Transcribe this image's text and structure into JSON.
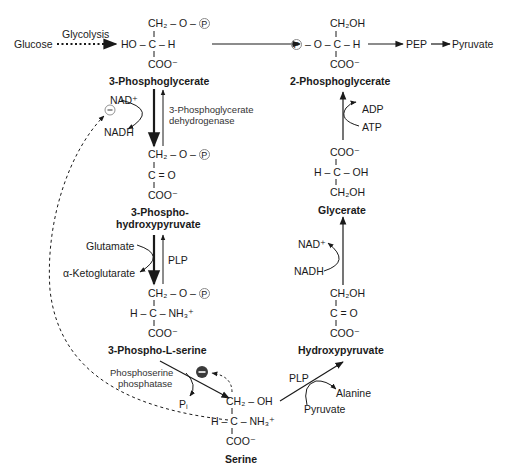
{
  "diagram": {
    "molecules": {
      "phosphoglycerate3": {
        "name": "3-Phosphoglycerate",
        "row1": "CH₂ – O –",
        "row2": "HO – C – H",
        "row3": "COO⁻"
      },
      "phosphoglycerate2": {
        "name": "2-Phosphoglycerate",
        "row1": "CH₂OH",
        "row2_left": "– O – C – H",
        "row3": "COO⁻"
      },
      "phosphohydroxypyruvate": {
        "name_line1": "3-Phospho-",
        "name_line2": "hydroxypyruvate",
        "row1": "CH₂ – O –",
        "row2": "C = O",
        "row3": "COO⁻"
      },
      "glycerate": {
        "name": "Glycerate",
        "row1": "COO⁻",
        "row2": "H – C – OH",
        "row3": "CH₂OH"
      },
      "phosphoserine": {
        "name": "3-Phospho-L-serine",
        "row1": "CH₂ – O –",
        "row2": "H – C – NH₃⁺",
        "row3": "COO⁻"
      },
      "hydroxypyruvate": {
        "name": "Hydroxypyruvate",
        "row1": "CH₂OH",
        "row2": "C = O",
        "row3": "COO⁻"
      },
      "serine": {
        "name": "Serine",
        "row1": "CH₂ – OH",
        "row2": "H – C – NH₃⁺",
        "row3": "COO⁻"
      }
    },
    "phosphate_symbol": "P",
    "labels": {
      "glucose": "Glucose",
      "glycolysis": "Glycolysis",
      "pep": "PEP",
      "pyruvate_top": "Pyruvate",
      "nad_plus_left": "NAD⁺",
      "nadh_left": "NADH",
      "enzyme_pgdh_line1": "3-Phosphoglycerate",
      "enzyme_pgdh_line2": "dehydrogenase",
      "glutamate": "Glutamate",
      "alpha_kg": "α-Ketoglutarate",
      "plp_left": "PLP",
      "enzyme_psp_line1": "Phosphoserine",
      "enzyme_psp_line2": "phosphatase",
      "pi": "Pᵢ",
      "plp_right": "PLP",
      "alanine": "Alanine",
      "pyruvate_bottom": "Pyruvate",
      "nad_plus_right": "NAD⁺",
      "nadh_right": "NADH",
      "adp": "ADP",
      "atp": "ATP",
      "inhibit_symbol": "−"
    }
  }
}
